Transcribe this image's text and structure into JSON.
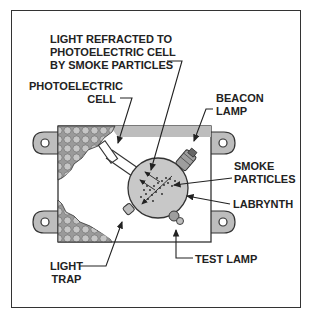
{
  "diagram": {
    "type": "photoelectric smoke detector cutaway",
    "labels": {
      "light_refracted": [
        "LIGHT REFRACTED TO",
        "PHOTOELECTRIC CELL",
        "BY SMOKE PARTICLES"
      ],
      "photoelectric_cell": [
        "PHOTOELECTRIC",
        "CELL"
      ],
      "beacon_lamp": [
        "BEACON",
        "LAMP"
      ],
      "smoke_particles": [
        "SMOKE",
        "PARTICLES"
      ],
      "labrynth": "LABRYNTH",
      "test_lamp": "TEST LAMP",
      "light_trap": [
        "LIGHT",
        "TRAP"
      ]
    },
    "colors": {
      "outline": "#333333",
      "housing_gray": "#bdbdbd",
      "chamber_gray": "#c8c8c8",
      "mesh_gray": "#a8a8a8",
      "background": "#ffffff"
    }
  }
}
